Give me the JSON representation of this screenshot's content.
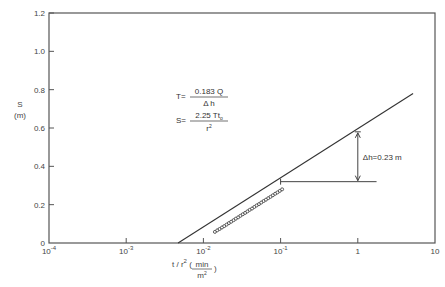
{
  "chart_data": {
    "type": "scatter",
    "title": "",
    "xscale": "log",
    "xlabel": "t / r² (min/m²)",
    "xlabel_parts": {
      "main": "t / r",
      "sup": "2",
      "paren_open": "(",
      "num": "min",
      "den": "m",
      "den_sup": "2",
      "paren_close": ")"
    },
    "ylabel": "S (m)",
    "ylabel_parts": {
      "line1": "S",
      "line2": "(m)"
    },
    "xlim": [
      0.0001,
      10
    ],
    "ylim": [
      0,
      1.2
    ],
    "x_ticks": [
      {
        "value": 0.0001,
        "base": "10",
        "exp": "-4"
      },
      {
        "value": 0.001,
        "base": "10",
        "exp": "-3"
      },
      {
        "value": 0.01,
        "base": "10",
        "exp": "-2"
      },
      {
        "value": 0.1,
        "base": "10",
        "exp": "-1"
      },
      {
        "value": 1,
        "base": "1",
        "exp": ""
      },
      {
        "value": 10,
        "base": "10",
        "exp": ""
      }
    ],
    "y_ticks": [
      {
        "value": 0,
        "label": "0"
      },
      {
        "value": 0.2,
        "label": "0.2"
      },
      {
        "value": 0.4,
        "label": "0.4"
      },
      {
        "value": 0.6,
        "label": "0.6"
      },
      {
        "value": 0.8,
        "label": "0.8"
      },
      {
        "value": 1.0,
        "label": "1.0"
      },
      {
        "value": 1.2,
        "label": "1.2"
      }
    ],
    "grid": false,
    "legend": null,
    "series": [
      {
        "name": "observed drawdown",
        "kind": "points",
        "marker": "circle-open",
        "x": [
          0.0141,
          0.0151,
          0.0162,
          0.0174,
          0.0186,
          0.02,
          0.0214,
          0.0229,
          0.0246,
          0.0263,
          0.0282,
          0.0302,
          0.0324,
          0.0347,
          0.0372,
          0.0398,
          0.0427,
          0.0457,
          0.049,
          0.0525,
          0.0562,
          0.0603,
          0.0646,
          0.0692,
          0.0741,
          0.0794,
          0.0851,
          0.0912,
          0.0977,
          0.1047
        ],
        "y": [
          0.058,
          0.066,
          0.073,
          0.081,
          0.088,
          0.096,
          0.104,
          0.111,
          0.119,
          0.127,
          0.134,
          0.142,
          0.15,
          0.157,
          0.165,
          0.173,
          0.18,
          0.188,
          0.196,
          0.203,
          0.211,
          0.219,
          0.226,
          0.234,
          0.241,
          0.249,
          0.257,
          0.264,
          0.272,
          0.28
        ]
      },
      {
        "name": "straight-line fit",
        "kind": "line",
        "x": [
          0.0047,
          5.2
        ],
        "y": [
          0.0,
          0.78
        ]
      }
    ],
    "annotations": [
      {
        "type": "text",
        "text": "T = 0.183 Q / Δh",
        "parts": {
          "lhs": "T=",
          "num": "0.183 Q",
          "den": "Δ h"
        }
      },
      {
        "type": "text",
        "text": "S = 2.25 T t₀ / r²",
        "parts": {
          "lhs": "S=",
          "num": "2.25 Tt",
          "num_sub": "o",
          "den": "r",
          "den_sup": "2"
        }
      },
      {
        "type": "dimension",
        "text": "Δh=0.23 m",
        "from": {
          "x": 1,
          "y": 0.32
        },
        "to": {
          "x": 1,
          "y": 0.58
        }
      },
      {
        "type": "baseline",
        "from_x": 0.1,
        "to_x": 1.75,
        "y": 0.32
      }
    ]
  }
}
